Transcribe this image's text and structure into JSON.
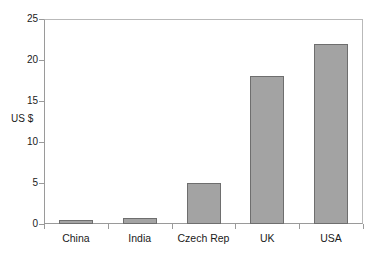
{
  "chart_data": {
    "type": "bar",
    "title": "",
    "subtitle": "",
    "xlabel": "",
    "ylabel": "US $",
    "ylim": [
      0,
      25
    ],
    "yticks": [
      0,
      5,
      10,
      15,
      20,
      25
    ],
    "ytick_labels": [
      "0",
      "5",
      "10",
      "15",
      "20",
      "25"
    ],
    "grid": false,
    "legend": false,
    "categories": [
      "China",
      "India",
      "Czech Rep",
      "UK",
      "USA"
    ],
    "values": [
      0.5,
      0.7,
      5,
      18,
      22
    ],
    "series": [
      {
        "name": "US $",
        "values": [
          0.5,
          0.7,
          5,
          18,
          22
        ]
      }
    ],
    "colors": {
      "bar_fill": "#a3a3a3",
      "bar_border": "#6e6e6e",
      "axis": "#9a9a9a",
      "frame": "#b9b9b9",
      "text": "#1a1a1a",
      "background": "#ffffff"
    }
  }
}
